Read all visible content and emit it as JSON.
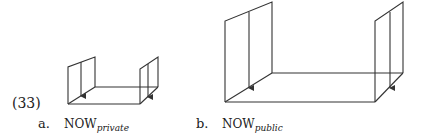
{
  "example_number": "(33)",
  "figures": [
    {
      "marker": "a.",
      "label_main": "NOW",
      "label_sub": "private",
      "description": "small box-like figure: two vertical panels with downward arrows joined by a floor plane"
    },
    {
      "marker": "b.",
      "label_main": "NOW",
      "label_sub": "public",
      "description": "large box-like figure: two tall vertical panels with downward arrows joined by a wide floor plane"
    }
  ],
  "colors": {
    "line": "#333333",
    "text": "#222222",
    "background": "#ffffff"
  }
}
